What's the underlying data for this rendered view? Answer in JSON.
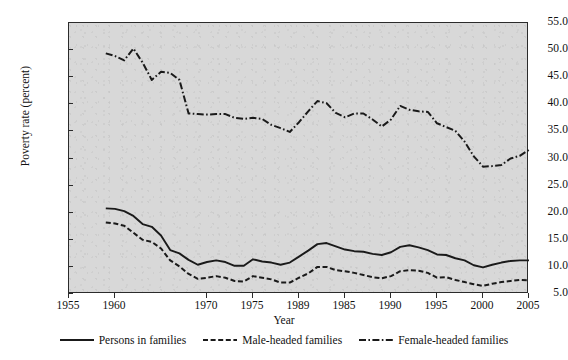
{
  "chart_data": {
    "type": "line",
    "title": "",
    "xlabel": "Year",
    "ylabel": "Poverty rate (percent)",
    "xlim": [
      1955,
      2005
    ],
    "ylim": [
      5.0,
      55.0
    ],
    "grid": false,
    "legend_position": "bottom",
    "xticks": [
      1955,
      1960,
      1970,
      1975,
      1989,
      1985,
      1990,
      1995,
      2000,
      2005
    ],
    "xtick_labels": [
      "1955",
      "1960",
      "1970",
      "1975",
      "1989",
      "1985",
      "1990",
      "1995",
      "2000",
      "2005"
    ],
    "xtick_positions": [
      1955,
      1960,
      1970,
      1975,
      1980,
      1985,
      1990,
      1995,
      2000,
      2005
    ],
    "yticks": [
      5.0,
      10.0,
      15.0,
      20.0,
      25.0,
      30.0,
      35.0,
      40.0,
      45.0,
      50.0,
      55.0
    ],
    "ytick_labels": [
      "5.0",
      "10.0",
      "15.0",
      "20.0",
      "25.0",
      "30.0",
      "35.0",
      "40.0",
      "45.0",
      "50.0",
      "55.0"
    ],
    "x": [
      1959,
      1960,
      1961,
      1962,
      1963,
      1964,
      1965,
      1966,
      1967,
      1968,
      1969,
      1970,
      1971,
      1972,
      1973,
      1974,
      1975,
      1976,
      1977,
      1978,
      1979,
      1980,
      1981,
      1982,
      1983,
      1984,
      1985,
      1986,
      1987,
      1988,
      1989,
      1990,
      1991,
      1992,
      1993,
      1994,
      1995,
      1996,
      1997,
      1998,
      1999,
      2000,
      2001,
      2002,
      2003,
      2004,
      2005
    ],
    "series": [
      {
        "name": "Persons in families",
        "style": "solid",
        "color": "#1a1a1a",
        "values": [
          20.8,
          20.7,
          20.3,
          19.4,
          17.9,
          17.4,
          15.8,
          13.1,
          12.5,
          11.3,
          10.4,
          10.9,
          11.2,
          10.9,
          10.2,
          10.2,
          11.4,
          11.0,
          10.8,
          10.4,
          10.8,
          11.9,
          13.0,
          14.2,
          14.4,
          13.8,
          13.2,
          12.9,
          12.8,
          12.4,
          12.2,
          12.7,
          13.7,
          14.0,
          13.6,
          13.1,
          12.3,
          12.2,
          11.6,
          11.2,
          10.3,
          9.9,
          10.4,
          10.8,
          11.1,
          11.2,
          11.2
        ],
        "first_value": 20.8,
        "last_value": 11.2,
        "min_value": 9.9,
        "max_value": 20.8
      },
      {
        "name": "Male-headed families",
        "style": "dashed",
        "color": "#1a1a1a",
        "values": [
          18.2,
          18.0,
          17.6,
          16.3,
          15.0,
          14.6,
          13.4,
          11.2,
          10.1,
          8.7,
          7.8,
          8.0,
          8.3,
          8.0,
          7.4,
          7.3,
          8.3,
          8.0,
          7.7,
          7.1,
          7.1,
          8.0,
          8.8,
          10.0,
          10.0,
          9.4,
          9.2,
          8.9,
          8.5,
          8.1,
          7.9,
          8.3,
          9.2,
          9.4,
          9.3,
          8.9,
          8.0,
          8.1,
          7.6,
          7.2,
          6.8,
          6.5,
          6.9,
          7.2,
          7.4,
          7.6,
          7.5
        ]
      },
      {
        "name": "Female-headed families",
        "style": "dash-dot",
        "color": "#1a1a1a",
        "values": [
          49.4,
          48.9,
          48.1,
          50.3,
          47.7,
          44.5,
          46.0,
          45.8,
          44.5,
          38.3,
          38.2,
          38.1,
          38.2,
          38.2,
          37.5,
          37.3,
          37.5,
          37.3,
          36.2,
          35.6,
          34.9,
          36.7,
          38.7,
          40.6,
          40.2,
          38.4,
          37.6,
          38.3,
          38.3,
          37.2,
          35.9,
          37.2,
          39.7,
          39.0,
          38.7,
          38.6,
          36.5,
          35.8,
          35.1,
          33.1,
          30.4,
          28.5,
          28.6,
          28.8,
          30.0,
          30.5,
          31.6
        ]
      }
    ]
  },
  "legend": {
    "entries": [
      {
        "label": "Persons in families",
        "style": "solid"
      },
      {
        "label": "Male-headed families",
        "style": "dashed"
      },
      {
        "label": "Female-headed families",
        "style": "dash-dot"
      }
    ]
  },
  "colors": {
    "line": "#1a1a1a",
    "panel_background": "#d8d8d8",
    "figure_background": "#ffffff",
    "axis": "#2b2b2b"
  }
}
